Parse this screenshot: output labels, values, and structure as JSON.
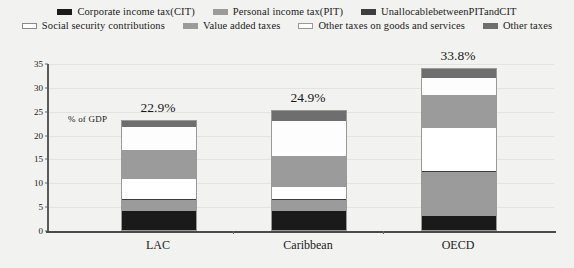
{
  "legend": {
    "rows": [
      [
        {
          "label": "Corporate income tax(CIT)",
          "color": "#1a1a1a",
          "key": "cit"
        },
        {
          "label": "Personal income tax(PIT)",
          "color": "#9b9b9b",
          "key": "pit"
        },
        {
          "label": "UnallocablebetweenPITandCIT",
          "color": "#3d3d3d",
          "key": "unallocable"
        }
      ],
      [
        {
          "label": "Social security contributions",
          "color": "#ffffff",
          "key": "ssc"
        },
        {
          "label": "Value added taxes",
          "color": "#9b9b9b",
          "key": "vat"
        },
        {
          "label": "Other taxes on goods and services",
          "color": "#fdfdfd",
          "key": "other_goods"
        },
        {
          "label": "Other taxes",
          "color": "#6e6e6e",
          "key": "other"
        }
      ]
    ]
  },
  "axis": {
    "ylabel": "% of GDP",
    "yticks": [
      "0",
      "5",
      "10",
      "15",
      "20",
      "25",
      "30",
      "35"
    ],
    "xlabels": [
      "LAC",
      "Caribbean",
      "OECD"
    ]
  },
  "chart_data": {
    "type": "bar",
    "subtype": "stacked",
    "title": "",
    "xlabel": "",
    "ylabel": "% of GDP",
    "ylim": [
      0,
      35
    ],
    "ytick_step": 5,
    "grid": true,
    "legend_position": "top",
    "categories": [
      "LAC",
      "Caribbean",
      "OECD"
    ],
    "totals": [
      22.9,
      24.9,
      33.8
    ],
    "total_labels": [
      "22.9%",
      "24.9%",
      "33.8%"
    ],
    "series": [
      {
        "name": "Corporate income tax(CIT)",
        "color": "#1a1a1a",
        "values": [
          3.9,
          4.0,
          2.9
        ]
      },
      {
        "name": "Personal income tax(PIT)",
        "color": "#9b9b9b",
        "values": [
          2.3,
          2.2,
          9.2
        ]
      },
      {
        "name": "UnallocablebetweenPITandCIT",
        "color": "#3d3d3d",
        "values": [
          0.3,
          0.3,
          0.2
        ]
      },
      {
        "name": "Social security contributions",
        "color": "#ffffff",
        "values": [
          4.2,
          2.5,
          9.0
        ]
      },
      {
        "name": "Value added taxes",
        "color": "#9b9b9b",
        "values": [
          6.0,
          6.6,
          7.0
        ]
      },
      {
        "name": "Other taxes on goods and services",
        "color": "#fdfdfd",
        "values": [
          5.0,
          7.3,
          3.5
        ]
      },
      {
        "name": "Other taxes",
        "color": "#6e6e6e",
        "values": [
          1.2,
          2.0,
          2.0
        ]
      }
    ]
  }
}
